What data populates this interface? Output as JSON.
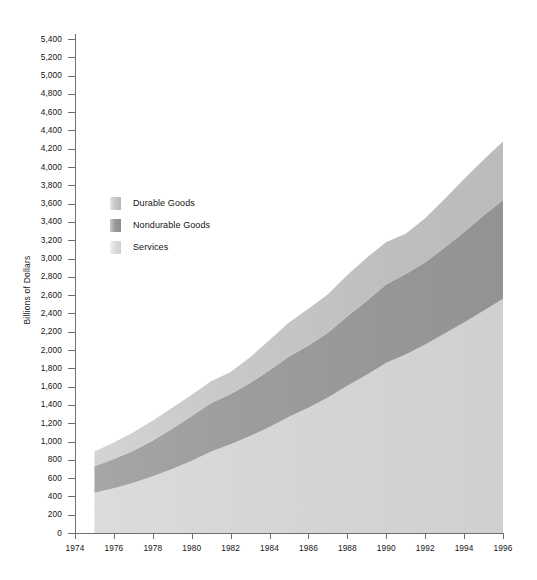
{
  "chart_data": {
    "type": "area",
    "title": "",
    "subtitle": "",
    "xlabel": "",
    "ylabel": "Billions of Dollars",
    "stacked": true,
    "grid": false,
    "legend_position": "inside-upper-left",
    "xlim": [
      1974,
      1996
    ],
    "ylim": [
      0,
      5400
    ],
    "x_tick_labels": [
      "1974",
      "1976",
      "1978",
      "1980",
      "1982",
      "1984",
      "1986",
      "1988",
      "1990",
      "1992",
      "1994",
      "1996"
    ],
    "x_tick_values": [
      1974,
      1976,
      1978,
      1980,
      1982,
      1984,
      1986,
      1988,
      1990,
      1992,
      1994,
      1996
    ],
    "y_tick_labels": [
      "0",
      "200",
      "400",
      "600",
      "800",
      "1,000",
      "1,200",
      "1,400",
      "1,600",
      "1,800",
      "2,000",
      "2,200",
      "2,400",
      "2,600",
      "2,800",
      "3,000",
      "3,200",
      "3,400",
      "3,600",
      "3,800",
      "4,000",
      "4,200",
      "4,400",
      "4,600",
      "4,800",
      "5,000",
      "5,200",
      "5,400"
    ],
    "y_tick_values": [
      0,
      200,
      400,
      600,
      800,
      1000,
      1200,
      1400,
      1600,
      1800,
      2000,
      2200,
      2400,
      2600,
      2800,
      3000,
      3200,
      3400,
      3600,
      3800,
      4000,
      4200,
      4400,
      4600,
      4800,
      5000,
      5200,
      5400
    ],
    "x": [
      1975,
      1976,
      1977,
      1978,
      1979,
      1980,
      1981,
      1982,
      1983,
      1984,
      1985,
      1986,
      1987,
      1988,
      1989,
      1990,
      1991,
      1992,
      1993,
      1994,
      1995,
      1996
    ],
    "series": [
      {
        "name": "Services",
        "color": "#d8d8d8",
        "values": [
          440,
          490,
          550,
          620,
          700,
          790,
          890,
          970,
          1060,
          1160,
          1270,
          1370,
          1480,
          1610,
          1730,
          1860,
          1950,
          2060,
          2180,
          2300,
          2430,
          2560
        ]
      },
      {
        "name": "Nondurable Goods",
        "color": "#9a9a9a",
        "values": [
          290,
          320,
          350,
          390,
          440,
          490,
          530,
          550,
          580,
          620,
          660,
          680,
          710,
          760,
          810,
          860,
          880,
          900,
          940,
          990,
          1040,
          1080
        ]
      },
      {
        "name": "Durable Goods",
        "color": "#c4c4c4",
        "values": [
          160,
          180,
          200,
          220,
          230,
          230,
          240,
          240,
          280,
          330,
          370,
          400,
          420,
          450,
          470,
          460,
          440,
          480,
          530,
          580,
          610,
          640
        ]
      }
    ],
    "stack_order_bottom_to_top": [
      "Services",
      "Nondurable Goods",
      "Durable Goods"
    ],
    "totals": [
      890,
      990,
      1100,
      1230,
      1370,
      1510,
      1660,
      1760,
      1920,
      2110,
      2300,
      2450,
      2610,
      2820,
      3010,
      3180,
      3270,
      3440,
      3650,
      3870,
      4080,
      4280
    ]
  },
  "legend": {
    "items": [
      {
        "label": "Durable Goods",
        "swatch": "durable-swatch"
      },
      {
        "label": "Nondurable Goods",
        "swatch": "nondurable-swatch"
      },
      {
        "label": "Services",
        "swatch": "services-swatch"
      }
    ]
  },
  "axis": {
    "y_title": "Billions of Dollars"
  },
  "colors": {
    "durable": "#c4c4c4",
    "nondurable": "#9a9a9a",
    "services": "#d8d8d8",
    "axis": "#6f6f6f",
    "text": "#141414",
    "background": "#ffffff"
  }
}
